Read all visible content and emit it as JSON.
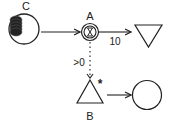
{
  "diagram": {
    "type": "machinations",
    "colors": {
      "stroke": "#222222",
      "background": "#ffffff"
    },
    "nodes": [
      {
        "id": "C",
        "label": "C",
        "shape": "pool-with-resources"
      },
      {
        "id": "A",
        "label": "A",
        "shape": "delay-double-circle-hourglass"
      },
      {
        "id": "drain",
        "label": "",
        "shape": "down-triangle"
      },
      {
        "id": "B",
        "label": "B",
        "shape": "up-triangle",
        "modifier": "*"
      },
      {
        "id": "pool2",
        "label": "",
        "shape": "circle"
      }
    ],
    "edges": [
      {
        "from": "C",
        "to": "A",
        "style": "solid",
        "label": ""
      },
      {
        "from": "A",
        "to": "drain",
        "style": "solid",
        "label": "10"
      },
      {
        "from": "A",
        "to": "B",
        "style": "dotted",
        "label": ">0"
      },
      {
        "from": "B",
        "to": "pool2",
        "style": "solid",
        "label": ""
      }
    ]
  }
}
